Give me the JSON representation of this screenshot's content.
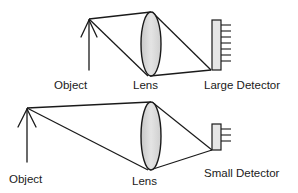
{
  "diagrams": [
    {
      "id": "top",
      "labels": {
        "object": "Object",
        "lens": "Lens",
        "detector": "Large Detector"
      },
      "detector_ticks": 8
    },
    {
      "id": "bottom",
      "labels": {
        "object": "Object",
        "lens": "Lens",
        "detector": "Small Detector"
      },
      "detector_ticks": 3
    }
  ],
  "colors": {
    "line": "#1a1a1a",
    "lens_fill": "#d9d9d9",
    "detector_fill": "#e6e6e6",
    "background": "#ffffff"
  }
}
